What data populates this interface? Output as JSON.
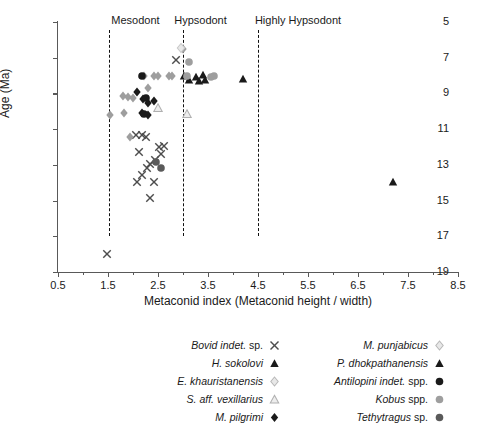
{
  "chart_data": {
    "type": "scatter",
    "title": "",
    "xlabel": "Metaconid index (Metaconid height / width)",
    "ylabel": "Age (Ma)",
    "xlim": [
      0.5,
      8.5
    ],
    "ylim": [
      19,
      5
    ],
    "y_inverted": true,
    "grid": false,
    "xticks": [
      0.5,
      1.5,
      2.5,
      3.5,
      4.5,
      5.5,
      6.5,
      7.5,
      8.5
    ],
    "xtick_labels": [
      "0.5",
      "1.5",
      "2.5",
      "3.5",
      "4.5",
      "5.5",
      "6.5",
      "7.5",
      "8.5"
    ],
    "xticks_minor": [
      1.0,
      2.0,
      3.0,
      4.0,
      5.0,
      6.0,
      7.0,
      8.0
    ],
    "yticks": [
      5,
      7,
      9,
      11,
      13,
      15,
      17,
      19
    ],
    "ytick_labels": [
      "5",
      "7",
      "9",
      "11",
      "13",
      "15",
      "17",
      "19"
    ],
    "legend_position": "below-plot-two-columns",
    "annotations": [
      {
        "name": "mesodont-zone-label",
        "text": "Mesodont",
        "x": 2.05,
        "y_px_top": 14
      },
      {
        "name": "hypsodont-zone-label",
        "text": "Hypsodont",
        "x": 3.35,
        "y_px_top": 14
      },
      {
        "name": "highly-hypsodont-zone-label",
        "text": "Highly Hypsodont",
        "x": 5.3,
        "y_px_top": 14
      }
    ],
    "dividers": [
      {
        "name": "mesodont-lower-divider",
        "x": 1.52,
        "style": "dashed",
        "color": "#111111"
      },
      {
        "name": "hypsodont-lower-divider",
        "x": 3.0,
        "style": "dashed",
        "color": "#111111"
      },
      {
        "name": "highly-hypsodont-lower-divider",
        "x": 4.5,
        "style": "dashed",
        "color": "#111111"
      }
    ],
    "series": [
      {
        "name": "Bovid indet. sp.",
        "label_italic": "Bovid indet. sp.",
        "marker": "x",
        "color": "#4d4d4d",
        "size": 7.5,
        "points": [
          [
            1.47,
            18.0
          ],
          [
            2.86,
            7.15
          ],
          [
            2.05,
            11.3
          ],
          [
            2.18,
            11.35
          ],
          [
            2.25,
            11.45
          ],
          [
            2.12,
            12.3
          ],
          [
            2.52,
            12.0
          ],
          [
            2.62,
            11.95
          ],
          [
            2.55,
            12.4
          ],
          [
            2.44,
            12.75
          ],
          [
            2.34,
            12.95
          ],
          [
            2.28,
            13.2
          ],
          [
            2.18,
            13.55
          ],
          [
            2.08,
            13.95
          ],
          [
            2.42,
            13.95
          ],
          [
            2.34,
            14.85
          ]
        ]
      },
      {
        "name": "H. sokolovi",
        "label_italic": "H. sokolovi",
        "marker": "triangle-up",
        "color": "#1a1a1a",
        "size": 8,
        "points": [
          [
            3.02,
            8.05
          ],
          [
            3.26,
            8.1
          ],
          [
            3.4,
            7.95
          ],
          [
            3.44,
            8.25
          ],
          [
            4.2,
            8.2
          ],
          [
            7.2,
            13.95
          ]
        ]
      },
      {
        "name": "E. khauristanensis",
        "label_italic": "E. khauristanensis",
        "marker": "diamond",
        "color": "#9e9e9e",
        "size": 8,
        "points": [
          [
            1.53,
            10.2
          ],
          [
            1.8,
            9.15
          ],
          [
            1.9,
            9.2
          ],
          [
            2.0,
            9.25
          ],
          [
            1.82,
            10.1
          ],
          [
            2.22,
            8.0
          ],
          [
            2.42,
            8.05
          ],
          [
            2.5,
            8.05
          ],
          [
            2.72,
            8.0
          ],
          [
            2.78,
            8.0
          ],
          [
            2.3,
            8.7
          ],
          [
            1.93,
            11.45
          ],
          [
            3.07,
            8.1
          ],
          [
            3.0,
            6.5
          ]
        ]
      },
      {
        "name": "S. aff. vexillarius",
        "label_italic": "S. aff. vexillarius",
        "marker": "triangle-up-open",
        "color": "#b0b0b0",
        "size": 8,
        "points": [
          [
            2.5,
            9.8
          ],
          [
            3.08,
            10.15
          ]
        ]
      },
      {
        "name": "M. pilgrimi",
        "label_italic": "M. pilgrimi",
        "marker": "diamond",
        "color": "#1a1a1a",
        "size": 8,
        "points": [
          [
            2.08,
            8.9
          ],
          [
            2.2,
            9.3
          ],
          [
            2.18,
            10.1
          ],
          [
            2.3,
            9.55
          ],
          [
            2.42,
            9.4
          ],
          [
            2.3,
            10.2
          ]
        ]
      },
      {
        "name": "M. punjabicus",
        "label_italic": "M. punjabicus",
        "marker": "diamond-open",
        "color": "#c8c8c8",
        "size": 8,
        "points": [
          [
            2.96,
            6.45
          ]
        ]
      },
      {
        "name": "P. dhokpathanensis",
        "label_italic": "P. dhokpathanensis",
        "marker": "triangle-up",
        "color": "#1a1a1a",
        "size": 8,
        "points": [
          [
            3.12,
            8.25
          ],
          [
            3.32,
            8.3
          ]
        ]
      },
      {
        "name": "Antilopini indet. spp.",
        "label_italic": "Antilopini indet. spp.",
        "marker": "circle",
        "color": "#1a1a1a",
        "size": 8,
        "points": [
          [
            2.18,
            8.0
          ],
          [
            2.25,
            9.25
          ],
          [
            2.22,
            10.15
          ]
        ]
      },
      {
        "name": "Kobus spp.",
        "label_italic": "Kobus",
        "label_roman": " spp.",
        "marker": "circle",
        "color": "#9e9e9e",
        "size": 8,
        "points": [
          [
            3.12,
            7.25
          ],
          [
            3.07,
            8.05
          ],
          [
            3.56,
            8.1
          ],
          [
            3.62,
            8.05
          ]
        ]
      },
      {
        "name": "Tethytragus sp.",
        "label_italic": "Tethytragus",
        "label_roman": " sp.",
        "marker": "circle",
        "color": "#5a5a5a",
        "size": 8,
        "points": [
          [
            2.46,
            12.85
          ],
          [
            2.56,
            13.2
          ]
        ]
      }
    ]
  },
  "legend": {
    "left_column": [
      {
        "name": "Bovid indet. sp.",
        "marker": "x",
        "color": "#4d4d4d"
      },
      {
        "name": "H. sokolovi",
        "marker": "triangle-up",
        "color": "#1a1a1a"
      },
      {
        "name": "E. khauristanensis",
        "marker": "diamond-open",
        "color": "#b8b8b8"
      },
      {
        "name": "S. aff. vexillarius",
        "marker": "triangle-up-open",
        "color": "#b0b0b0"
      },
      {
        "name": "M. pilgrimi",
        "marker": "diamond",
        "color": "#1a1a1a"
      }
    ],
    "right_column": [
      {
        "name": "M. punjabicus",
        "marker": "diamond-open",
        "color": "#b8b8b8"
      },
      {
        "name": "P. dhokpathanensis",
        "marker": "triangle-up",
        "color": "#1a1a1a"
      },
      {
        "name": "Antilopini indet. spp.",
        "marker": "circle",
        "color": "#1a1a1a"
      },
      {
        "name": "Kobus spp.",
        "marker": "circle",
        "color": "#9e9e9e"
      },
      {
        "name": "Tethytragus sp.",
        "marker": "circle",
        "color": "#5a5a5a"
      }
    ]
  }
}
